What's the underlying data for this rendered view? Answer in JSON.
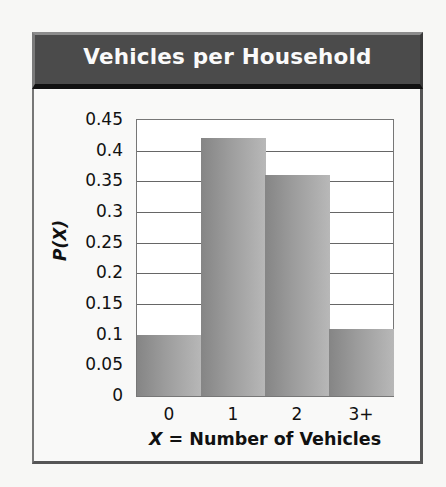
{
  "header": {
    "title": "Vehicles per Household"
  },
  "axes": {
    "ylabel": "P(X)",
    "xlabel_var": "X",
    "xlabel_eq": " = ",
    "xlabel_text": "Number of Vehicles",
    "yticks": [
      "0.45",
      "0.4",
      "0.35",
      "0.3",
      "0.25",
      "0.2",
      "0.15",
      "0.1",
      "0.05",
      "0"
    ],
    "xticks": [
      "0",
      "1",
      "2",
      "3+"
    ]
  },
  "chart_data": {
    "type": "bar",
    "title": "Vehicles per Household",
    "categories": [
      "0",
      "1",
      "2",
      "3+"
    ],
    "values": [
      0.1,
      0.42,
      0.36,
      0.11
    ],
    "xlabel": "X = Number of Vehicles",
    "ylabel": "P(X)",
    "ylim": [
      0,
      0.45
    ],
    "yticks": [
      0,
      0.05,
      0.1,
      0.15,
      0.2,
      0.25,
      0.3,
      0.35,
      0.4,
      0.45
    ],
    "grid": true,
    "legend": null,
    "colors": {
      "bar_dark": "#858585",
      "bar_light": "#b8b8b8",
      "header_bg": "#4b4b4b",
      "header_text": "#fafafa"
    }
  }
}
